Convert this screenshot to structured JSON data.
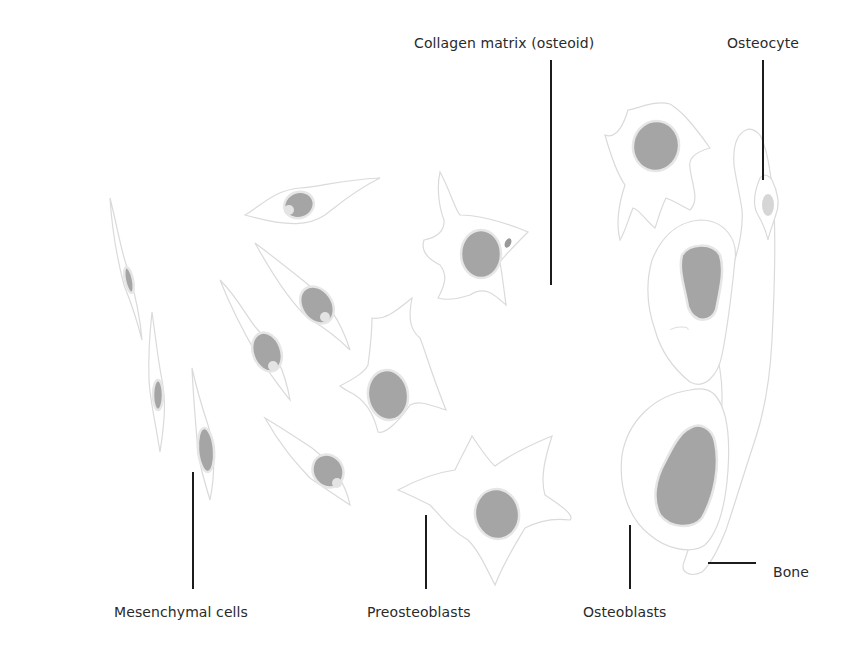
{
  "labels": {
    "collagen": "Collagen matrix (osteoid)",
    "osteocyte": "Osteocyte",
    "mesenchymal": "Mesenchymal cells",
    "preosteoblasts": "Preosteoblasts",
    "osteoblasts": "Osteoblasts",
    "bone": "Bone"
  },
  "colors": {
    "background": "#ffffff",
    "nucleus": "#a3a3a3",
    "cell_outline": "#dcdcdc",
    "leader_line": "#1c1c1c",
    "text": "#2a2a2a"
  }
}
